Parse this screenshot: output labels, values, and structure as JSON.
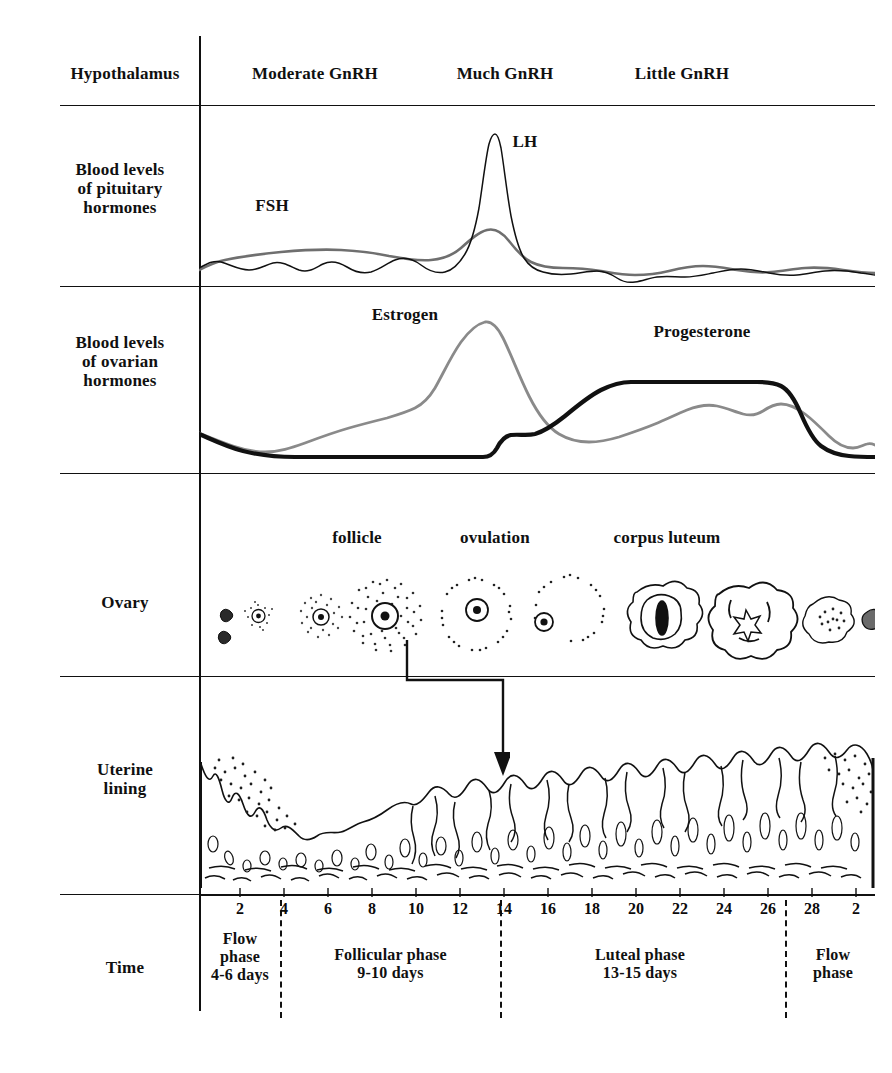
{
  "rows": [
    {
      "key": "hypothalamus",
      "label": "Hypothalamus"
    },
    {
      "key": "pituitary",
      "label": "Blood levels\nof pituitary\nhormones"
    },
    {
      "key": "ovarian",
      "label": "Blood levels\nof ovarian\nhormones"
    },
    {
      "key": "ovary",
      "label": "Ovary"
    },
    {
      "key": "uterine",
      "label": "Uterine\nlining"
    },
    {
      "key": "time",
      "label": "Time"
    }
  ],
  "hypothalamus": {
    "segments": [
      {
        "label": "Moderate GnRH",
        "x": 315
      },
      {
        "label": "Much GnRH",
        "x": 505
      },
      {
        "label": "Little GnRH",
        "x": 680
      }
    ]
  },
  "pituitary": {
    "curve_labels": [
      {
        "label": "FSH",
        "x": 272,
        "y": 205
      },
      {
        "label": "LH",
        "x": 522,
        "y": 140
      }
    ]
  },
  "ovarian": {
    "curve_labels": [
      {
        "label": "Estrogen",
        "x": 400,
        "y": 313
      },
      {
        "label": "Progestero{ne}",
        "x": 700,
        "y": 330
      }
    ],
    "estrogen_label": "Estrogen",
    "progesterone_label": "Progesterone"
  },
  "ovary": {
    "stage_labels": [
      {
        "label": "follicle",
        "x": 357,
        "y": 536
      },
      {
        "label": "ovulation",
        "x": 494,
        "y": 536
      },
      {
        "label": "corpus luteum",
        "x": 663,
        "y": 536
      }
    ]
  },
  "time": {
    "day_ticks": [
      2,
      4,
      6,
      8,
      10,
      12,
      14,
      16,
      18,
      20,
      22,
      24,
      26,
      28,
      2
    ],
    "phases": [
      {
        "name": "Flow\nphase\n4-6 days",
        "center": 240
      },
      {
        "name": "Follicular phase\n9-10 days",
        "center": 390
      },
      {
        "name": "Luteal phase\n13-15 days",
        "center": 640
      },
      {
        "name": "Flow\nphase",
        "center": 835
      }
    ],
    "phase_boundaries_x": [
      280,
      500,
      785
    ]
  },
  "colors": {
    "ink": "#111111",
    "estrogen": "#8a8a8a",
    "progesterone": "#111111",
    "fsh": "#6f6f6f",
    "lh": "#111111",
    "stipple": "#2a2a2a"
  },
  "chart_data": [
    {
      "type": "line",
      "title": "Blood levels of pituitary hormones",
      "xlabel": "Time (cycle day)",
      "ylabel": "Blood level",
      "x": [
        0,
        2,
        4,
        6,
        8,
        10,
        12,
        13,
        14,
        15,
        16,
        18,
        20,
        22,
        24,
        26,
        28,
        30
      ],
      "xlim": [
        0,
        30
      ],
      "grid": false,
      "series": [
        {
          "name": "LH",
          "values": [
            8,
            7,
            8,
            9,
            9,
            10,
            14,
            45,
            92,
            40,
            16,
            12,
            9,
            12,
            10,
            13,
            11,
            10
          ]
        },
        {
          "name": "FSH",
          "values": [
            10,
            12,
            14,
            16,
            16,
            15,
            18,
            24,
            30,
            24,
            17,
            13,
            11,
            11,
            12,
            12,
            12,
            11
          ]
        }
      ]
    },
    {
      "type": "line",
      "title": "Blood levels of ovarian hormones",
      "xlabel": "Time (cycle day)",
      "ylabel": "Blood level",
      "x": [
        0,
        2,
        4,
        6,
        8,
        10,
        12,
        13,
        14,
        15,
        16,
        18,
        20,
        22,
        24,
        26,
        28,
        30
      ],
      "xlim": [
        0,
        30
      ],
      "grid": false,
      "series": [
        {
          "name": "Estrogen",
          "values": [
            22,
            14,
            16,
            24,
            32,
            40,
            70,
            86,
            72,
            36,
            26,
            34,
            48,
            44,
            50,
            30,
            20,
            19
          ]
        },
        {
          "name": "Progesterone",
          "values": [
            18,
            8,
            6,
            6,
            6,
            6,
            6,
            8,
            18,
            26,
            40,
            66,
            74,
            74,
            74,
            72,
            26,
            12
          ]
        }
      ]
    }
  ]
}
